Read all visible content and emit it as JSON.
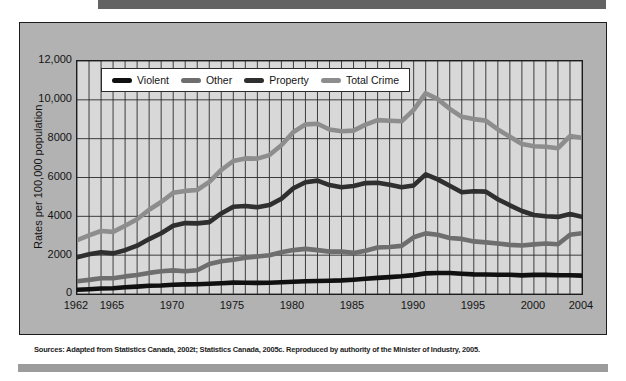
{
  "page": {
    "source_note": "Sources: Adapted from Statistics Canada, 2002t; Statistics Canada, 2005c. Reproduced by authority of the Minister of Industry, 2005."
  },
  "colors": {
    "top_bar": "#636363",
    "bottom_bar": "#9c9c9c",
    "panel_bg": "#b2b2b2",
    "plot_bg": "#d8d8d8",
    "grid_line": "#2b2b2b",
    "frame": "#1c1c1c",
    "legend_bg": "#ffffff"
  },
  "chart_data": {
    "type": "line",
    "title": "",
    "xlabel": "",
    "ylabel": "Rates per 100,000 population",
    "xlim": [
      1962,
      2004
    ],
    "ylim": [
      0,
      12000
    ],
    "grid": true,
    "legend_position": "top-inside",
    "ytick_labels": [
      "12,000",
      "10,000",
      "8000",
      "6000",
      "4000",
      "2000",
      "0"
    ],
    "ytick_values": [
      12000,
      10000,
      8000,
      6000,
      4000,
      2000,
      0
    ],
    "xtick_labels": [
      "1962",
      "1965",
      "1970",
      "1975",
      "1980",
      "1985",
      "1990",
      "1995",
      "2000",
      "2004"
    ],
    "xtick_values": [
      1962,
      1965,
      1970,
      1975,
      1980,
      1985,
      1990,
      1995,
      2000,
      2004
    ],
    "x": [
      1962,
      1963,
      1964,
      1965,
      1966,
      1967,
      1968,
      1969,
      1970,
      1971,
      1972,
      1973,
      1974,
      1975,
      1976,
      1977,
      1978,
      1979,
      1980,
      1981,
      1982,
      1983,
      1984,
      1985,
      1986,
      1987,
      1988,
      1989,
      1990,
      1991,
      1992,
      1993,
      1994,
      1995,
      1996,
      1997,
      1998,
      1999,
      2000,
      2001,
      2002,
      2003,
      2004
    ],
    "series": [
      {
        "name": "Violent",
        "color": "#101010",
        "values": [
          221,
          249,
          284,
          299,
          347,
          381,
          423,
          438,
          481,
          492,
          497,
          524,
          553,
          585,
          584,
          572,
          580,
          610,
          636,
          654,
          671,
          679,
          701,
          735,
          785,
          829,
          868,
          911,
          973,
          1059,
          1084,
          1079,
          1047,
          1007,
          1002,
          993,
          995,
          958,
          982,
          984,
          969,
          963,
          946
        ]
      },
      {
        "name": "Other",
        "color": "#6e6e6e",
        "values": [
          659,
          726,
          815,
          809,
          906,
          981,
          1087,
          1172,
          1216,
          1170,
          1224,
          1545,
          1684,
          1769,
          1867,
          1933,
          1995,
          2153,
          2263,
          2323,
          2262,
          2183,
          2185,
          2118,
          2228,
          2397,
          2421,
          2478,
          2919,
          3123,
          3052,
          2884,
          2838,
          2709,
          2656,
          2602,
          2530,
          2499,
          2555,
          2599,
          2566,
          3048,
          3128
        ]
      },
      {
        "name": "Property",
        "color": "#2f2f2f",
        "values": [
          1891,
          2047,
          2146,
          2091,
          2258,
          2488,
          2826,
          3127,
          3515,
          3649,
          3634,
          3704,
          4151,
          4498,
          4533,
          4466,
          4579,
          4903,
          5444,
          5759,
          5840,
          5608,
          5501,
          5560,
          5714,
          5731,
          5630,
          5503,
          5593,
          6160,
          5904,
          5575,
          5240,
          5292,
          5274,
          4880,
          4569,
          4276,
          4070,
          4004,
          3973,
          4121,
          3977
        ]
      },
      {
        "name": "Total Crime",
        "color": "#8d8d8d",
        "values": [
          2771,
          3022,
          3245,
          3199,
          3511,
          3850,
          4336,
          4737,
          5212,
          5311,
          5355,
          5773,
          6388,
          6852,
          6984,
          6971,
          7154,
          7666,
          8343,
          8736,
          8773,
          8470,
          8387,
          8413,
          8727,
          8957,
          8919,
          8892,
          9485,
          10342,
          10040,
          9538,
          9125,
          9008,
          8932,
          8475,
          8094,
          7733,
          7607,
          7587,
          7508,
          8132,
          8051
        ]
      }
    ]
  }
}
